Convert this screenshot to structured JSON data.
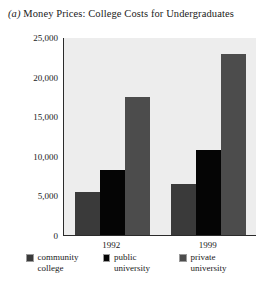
{
  "figure": {
    "panel_letter": "(a)",
    "title": "Money Prices: College Costs for Undergraduates"
  },
  "chart_data": {
    "type": "bar",
    "title": "Money Prices: College Costs for Undergraduates",
    "xlabel": "",
    "ylabel": "",
    "categories": [
      "1992",
      "1999"
    ],
    "series": [
      {
        "name": "community college",
        "color": "#3a3a3a",
        "values": [
          5400,
          6400
        ]
      },
      {
        "name": "public university",
        "color": "#050505",
        "values": [
          8200,
          10700
        ]
      },
      {
        "name": "private university",
        "color": "#4c4c4c",
        "values": [
          17400,
          22900
        ]
      }
    ],
    "ylim": [
      0,
      25000
    ],
    "yticks": [
      0,
      5000,
      10000,
      15000,
      20000,
      25000
    ],
    "ytick_labels": [
      "0",
      "5,000",
      "10,000",
      "15,000",
      "20,000",
      "25,000"
    ],
    "grid": false,
    "legend_position": "bottom",
    "plot_background": "#ededed",
    "axis_color": "#2b2b2b"
  },
  "legend": {
    "items": [
      {
        "label": "community college",
        "color": "#3a3a3a"
      },
      {
        "label": "public university",
        "color": "#050505"
      },
      {
        "label": "private university",
        "color": "#4c4c4c"
      }
    ]
  }
}
